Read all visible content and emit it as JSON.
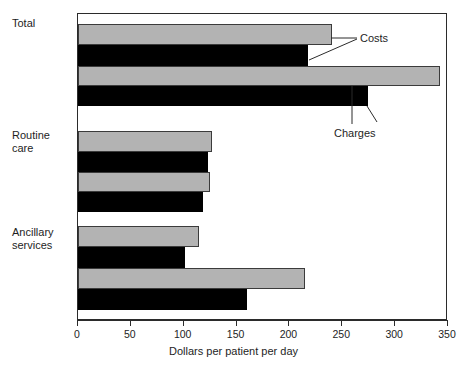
{
  "chart_data": {
    "type": "bar",
    "orientation": "horizontal",
    "title": "",
    "xlabel": "Dollars per patient per day",
    "ylabel": "",
    "xlim": [
      0,
      350
    ],
    "xticks": [
      0,
      50,
      100,
      150,
      200,
      250,
      300,
      350
    ],
    "xtick_labels": [
      "0",
      "50",
      "100",
      "150",
      "200",
      "250",
      "300",
      "350"
    ],
    "grid": false,
    "legend_position": "annotated-callouts",
    "categories": [
      "Total",
      "Routine care",
      "Ancillary services"
    ],
    "series": [
      {
        "name": "Costs",
        "style": "gray",
        "values": [
          240,
          127,
          114
        ]
      },
      {
        "name": "Costs",
        "style": "black",
        "values": [
          218,
          123,
          101
        ]
      },
      {
        "name": "Charges",
        "style": "gray",
        "values": [
          342,
          125,
          215
        ]
      },
      {
        "name": "Charges",
        "style": "black",
        "values": [
          274,
          118,
          160
        ]
      }
    ],
    "annotations": [
      {
        "label": "Costs",
        "points_to": [
          "series-1-total-gray",
          "series-2-total-black"
        ]
      },
      {
        "label": "Charges",
        "points_to": [
          "series-3-total-gray",
          "series-4-total-black"
        ]
      }
    ]
  },
  "axis": {
    "x_title": "Dollars per patient per day",
    "ticks": [
      {
        "value": 0,
        "label": "0"
      },
      {
        "value": 50,
        "label": "50"
      },
      {
        "value": 100,
        "label": "100"
      },
      {
        "value": 150,
        "label": "150"
      },
      {
        "value": 200,
        "label": "200"
      },
      {
        "value": 250,
        "label": "250"
      },
      {
        "value": 300,
        "label": "300"
      },
      {
        "value": 350,
        "label": "350"
      }
    ]
  },
  "categories": {
    "total": "Total",
    "routine": "Routine\ncare",
    "ancillary": "Ancillary\nservices"
  },
  "annotations": {
    "costs": "Costs",
    "charges": "Charges"
  },
  "colors": {
    "bar_gray": "#b3b3b3",
    "bar_black": "#000000",
    "frame": "#2b2b2b",
    "text": "#1e1e1e",
    "background": "#ffffff"
  }
}
